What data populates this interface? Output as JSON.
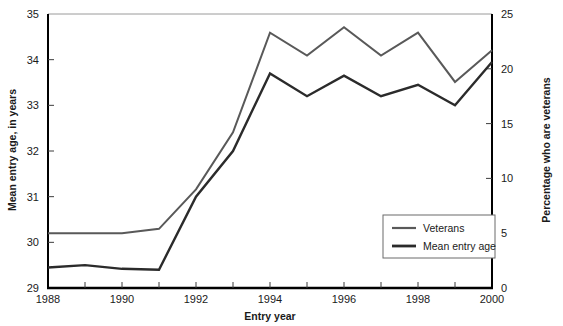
{
  "chart_data": {
    "type": "line",
    "title": "",
    "xlabel": "Entry year",
    "ylabel": "Mean entry age, in years",
    "y2label": "Percentage who are veterans",
    "x": [
      1988,
      1989,
      1990,
      1991,
      1992,
      1993,
      1994,
      1995,
      1996,
      1997,
      1998,
      1999,
      2000
    ],
    "xlim": [
      1988,
      2000
    ],
    "xticks": [
      1988,
      1990,
      1992,
      1994,
      1996,
      1998,
      2000
    ],
    "xticklabels": [
      "1988",
      "1990",
      "1992",
      "1994",
      "1996",
      "1998",
      "2000"
    ],
    "xminorticks": [
      1989,
      1991,
      1993,
      1995,
      1997,
      1999
    ],
    "ylim": [
      29,
      35
    ],
    "yticks": [
      29,
      30,
      31,
      32,
      33,
      34,
      35
    ],
    "yticklabels": [
      "29",
      "30",
      "31",
      "32",
      "33",
      "34",
      "35"
    ],
    "y2lim": [
      0,
      25
    ],
    "y2ticks": [
      0,
      5,
      10,
      15,
      20,
      25
    ],
    "y2ticklabels": [
      "0",
      "5",
      "10",
      "15",
      "20",
      "25"
    ],
    "grid": false,
    "legend_position": "lower right",
    "series": [
      {
        "name": "Veterans",
        "axis": "right",
        "color": "#595959",
        "width": 2.0,
        "values_pct": [
          5.0,
          5.0,
          5.0,
          5.4,
          9.0,
          14.2,
          23.3,
          21.2,
          23.8,
          21.2,
          23.3,
          18.8,
          21.7
        ],
        "values_left_equiv": [
          30.2,
          30.2,
          30.2,
          30.3,
          31.2,
          32.4,
          34.6,
          34.1,
          34.7,
          34.1,
          34.6,
          33.5,
          34.2
        ]
      },
      {
        "name": "Mean entry age",
        "axis": "left",
        "color": "#2b2b2b",
        "width": 2.4,
        "values": [
          29.45,
          29.5,
          29.42,
          29.4,
          31.0,
          32.0,
          33.7,
          33.2,
          33.65,
          33.2,
          33.45,
          33.0,
          33.95
        ]
      }
    ]
  },
  "legend": {
    "entries": [
      {
        "label": "Veterans"
      },
      {
        "label": "Mean entry age"
      }
    ]
  },
  "colors": {
    "veterans_line": "#595959",
    "mean_entry_age_line": "#2b2b2b",
    "axis": "#000000",
    "background": "#ffffff"
  }
}
